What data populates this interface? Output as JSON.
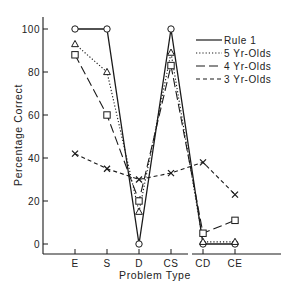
{
  "chart_data": {
    "type": "line",
    "title": "",
    "xlabel": "Problem Type",
    "ylabel": "Percentage Correct",
    "categories": [
      "E",
      "S",
      "D",
      "CS",
      "CD",
      "CE"
    ],
    "ylim": [
      0,
      100
    ],
    "yticks": [
      0,
      20,
      40,
      60,
      80,
      100
    ],
    "ytick_labels": [
      "0",
      "20",
      "40",
      "60",
      "80",
      "100"
    ],
    "grid": false,
    "legend_position": "upper right",
    "series": [
      {
        "name": "Rule 1",
        "line_style": "solid",
        "marker": "circle",
        "values": [
          100,
          100,
          0,
          100,
          0,
          0
        ]
      },
      {
        "name": "5 Yr-Olds",
        "line_style": "dotted",
        "marker": "triangle",
        "values": [
          93,
          80,
          15,
          89,
          1,
          1
        ]
      },
      {
        "name": "4 Yr-Olds",
        "line_style": "long-dash",
        "marker": "square",
        "values": [
          88,
          60,
          20,
          83,
          5,
          11
        ]
      },
      {
        "name": "3 Yr-Olds",
        "line_style": "short-dash",
        "marker": "x",
        "values": [
          42,
          35,
          30,
          33,
          38,
          23
        ]
      }
    ],
    "segments_note": "Lines connect E-S-D-CS and CD-CE; CS connects down to CD"
  },
  "legend": {
    "items": [
      {
        "label": "Rule 1"
      },
      {
        "label": "5 Yr-Olds"
      },
      {
        "label": "4 Yr-Olds"
      },
      {
        "label": "3 Yr-Olds"
      }
    ]
  },
  "colors": {
    "ink": "#1a1a1a",
    "background": "#ffffff"
  }
}
